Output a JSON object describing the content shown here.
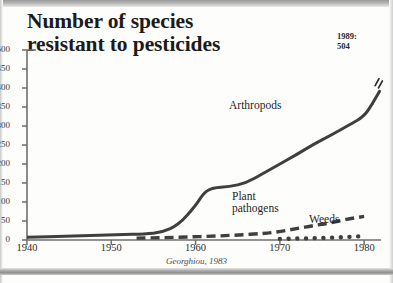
{
  "title": {
    "line1": "Number of species",
    "line2": "resistant to pesticides"
  },
  "annotation": {
    "year": "1989:",
    "value": "504"
  },
  "source": "Georghiou, 1983",
  "series_labels": {
    "arthropods": "Arthropods",
    "plant_pathogens_line1": "Plant",
    "plant_pathogens_line2": "pathogens",
    "weeds": "Weeds"
  },
  "chart_data": {
    "type": "line",
    "title": "Number of species resistant to pesticides",
    "xlabel": "",
    "ylabel": "",
    "xlim": [
      1940,
      1982
    ],
    "ylim": [
      0,
      500
    ],
    "grid": false,
    "legend": "inline-labels",
    "source": "Georghiou, 1983",
    "xticks": [
      1940,
      1950,
      1960,
      1970,
      1980
    ],
    "yticks": [
      0,
      50,
      100,
      150,
      200,
      250,
      300,
      350,
      400,
      450,
      500
    ],
    "annotations": [
      {
        "text": "1989: 504",
        "x": 1989,
        "y": 504,
        "note": "axis-break jump at right end of Arthropods line"
      }
    ],
    "series": [
      {
        "name": "Arthropods",
        "style": "solid",
        "color": "#3f3f3f",
        "x": [
          1940,
          1945,
          1948,
          1951,
          1954,
          1956,
          1958,
          1960,
          1961,
          1962,
          1964,
          1966,
          1968,
          1970,
          1972,
          1974,
          1976,
          1978,
          1980,
          1981
        ],
        "values": [
          7,
          10,
          12,
          14,
          16,
          20,
          40,
          90,
          125,
          137,
          140,
          150,
          175,
          200,
          225,
          252,
          275,
          300,
          325,
          360
        ]
      },
      {
        "name": "Plant pathogens",
        "style": "dashed",
        "color": "#3f3f3f",
        "x": [
          1953,
          1956,
          1959,
          1962,
          1965,
          1968,
          1970,
          1972,
          1974,
          1976,
          1978,
          1980
        ],
        "values": [
          5,
          6,
          8,
          10,
          13,
          17,
          22,
          30,
          38,
          45,
          55,
          62
        ]
      },
      {
        "name": "Weeds",
        "style": "dotted",
        "color": "#3f3f3f",
        "x": [
          1970,
          1971,
          1972,
          1973,
          1974,
          1975,
          1976,
          1977,
          1978,
          1979,
          1980
        ],
        "values": [
          3,
          3,
          4,
          4,
          5,
          5,
          6,
          7,
          8,
          9,
          11
        ]
      }
    ]
  }
}
